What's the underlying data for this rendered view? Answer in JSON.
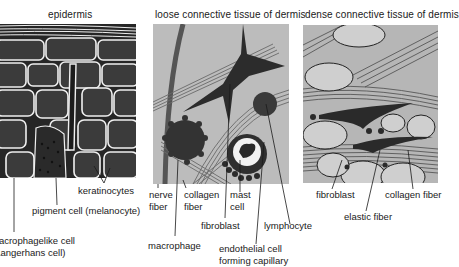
{
  "panels": {
    "epidermis": {
      "title": "epidermis",
      "labels": {
        "keratinocytes": "keratinocytes",
        "melanocyte": "pigment cell (melanocyte)",
        "langerhans_line1": "macrophagelike cell",
        "langerhans_line2": "(Langerhans cell)"
      }
    },
    "loose": {
      "title": "loose connective tissue of dermis",
      "labels": {
        "nerve_line1": "nerve",
        "nerve_line2": "fiber",
        "collagen_line1": "collagen",
        "collagen_line2": "fiber",
        "mast_line1": "mast",
        "mast_line2": "cell",
        "fibroblast": "fibroblast",
        "lymphocyte": "lymphocyte",
        "macrophage": "macrophage",
        "endothelial_line1": "endothelial cell",
        "endothelial_line2": "forming capillary"
      }
    },
    "dense": {
      "title": "dense connective tissue of dermis",
      "labels": {
        "fibroblast": "fibroblast",
        "collagen": "collagen fiber",
        "elastic": "elastic fiber"
      }
    }
  },
  "colors": {
    "epidermis_bg": "#2b2b2b",
    "cell_fill": "#3a3a3a",
    "membrane": "#f2f2f2",
    "loose_bg": "#bdbdbd",
    "dense_bg": "#b5b5b5",
    "cell_dark": "#2e2e2e",
    "ink": "#1a1a1a"
  }
}
